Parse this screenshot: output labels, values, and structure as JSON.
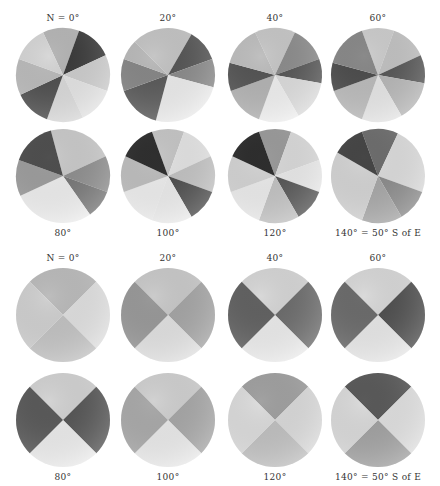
{
  "figure": {
    "upper_set": {
      "disks": [
        {
          "label": "N = 0°",
          "label_pos": "top",
          "cx": 63,
          "cy": 75,
          "r": 47,
          "sectors": [
            [
              "#b8b8b8",
              -25,
              20
            ],
            [
              "#3a3a3a",
              20,
              65
            ],
            [
              "#cfcfcf",
              65,
              110
            ],
            [
              "#e6e6e6",
              110,
              155
            ],
            [
              "#dcdcdc",
              155,
              200
            ],
            [
              "#4e4e4e",
              200,
              245
            ],
            [
              "#bdbdbd",
              245,
              290
            ],
            [
              "#d8d8d8",
              290,
              335
            ]
          ]
        },
        {
          "label": "20°",
          "label_pos": "top",
          "cx": 168,
          "cy": 75,
          "r": 47,
          "sectors": [
            [
              "#c6c6c6",
              -45,
              30
            ],
            [
              "#555555",
              30,
              70
            ],
            [
              "#8a8a8a",
              70,
              105
            ],
            [
              "#eeeeee",
              105,
              195
            ],
            [
              "#5a5a5a",
              195,
              250
            ],
            [
              "#888888",
              250,
              290
            ],
            [
              "#bcbcbc",
              290,
              315
            ]
          ]
        },
        {
          "label": "40°",
          "label_pos": "top",
          "cx": 275,
          "cy": 75,
          "r": 47,
          "sectors": [
            [
              "#c9c9c9",
              -25,
              25
            ],
            [
              "#8d8d8d",
              25,
              70
            ],
            [
              "#555555",
              70,
              100
            ],
            [
              "#dedede",
              100,
              150
            ],
            [
              "#f2f2f2",
              150,
              200
            ],
            [
              "#b5b5b5",
              200,
              250
            ],
            [
              "#555555",
              250,
              285
            ],
            [
              "#c0c0c0",
              285,
              335
            ]
          ]
        },
        {
          "label": "60°",
          "label_pos": "top",
          "cx": 378,
          "cy": 75,
          "r": 47,
          "sectors": [
            [
              "#cfcfcf",
              -20,
              20
            ],
            [
              "#c4c4c4",
              20,
              65
            ],
            [
              "#555555",
              65,
              100
            ],
            [
              "#b8b8b8",
              100,
              150
            ],
            [
              "#e8e8e8",
              150,
              200
            ],
            [
              "#bdbdbd",
              200,
              250
            ],
            [
              "#4d4d4d",
              250,
              285
            ],
            [
              "#8a8a8a",
              285,
              340
            ]
          ]
        },
        {
          "label": "80°",
          "label_pos": "bottom",
          "cx": 63,
          "cy": 176,
          "r": 47,
          "sectors": [
            [
              "#cccccc",
              -15,
              65
            ],
            [
              "#8f8f8f",
              65,
              110
            ],
            [
              "#777777",
              110,
              145
            ],
            [
              "#f0f0f0",
              145,
              245
            ],
            [
              "#9e9e9e",
              245,
              290
            ],
            [
              "#4f4f4f",
              290,
              345
            ]
          ]
        },
        {
          "label": "100°",
          "label_pos": "bottom",
          "cx": 168,
          "cy": 176,
          "r": 47,
          "sectors": [
            [
              "#c8c8c8",
              -20,
              20
            ],
            [
              "#e6e6e6",
              20,
              65
            ],
            [
              "#c4c4c4",
              65,
              110
            ],
            [
              "#4c4c4c",
              110,
              150
            ],
            [
              "#eeeeee",
              150,
              200
            ],
            [
              "#f0f0f0",
              200,
              250
            ],
            [
              "#c0c0c0",
              250,
              295
            ],
            [
              "#2f2f2f",
              295,
              340
            ]
          ]
        },
        {
          "label": "120°",
          "label_pos": "bottom",
          "cx": 275,
          "cy": 176,
          "r": 47,
          "sectors": [
            [
              "#9c9c9c",
              -20,
              20
            ],
            [
              "#dcdcdc",
              20,
              70
            ],
            [
              "#ececec",
              70,
              110
            ],
            [
              "#555555",
              110,
              150
            ],
            [
              "#c4c4c4",
              150,
              200
            ],
            [
              "#eeeeee",
              200,
              250
            ],
            [
              "#d6d6d6",
              250,
              295
            ],
            [
              "#2e2e2e",
              295,
              340
            ]
          ]
        },
        {
          "label": "140° = 50° S of E",
          "label_pos": "bottom",
          "cx": 378,
          "cy": 176,
          "r": 47,
          "sectors": [
            [
              "#6e6e6e",
              -20,
              25
            ],
            [
              "#dedede",
              25,
              110
            ],
            [
              "#8c8c8c",
              110,
              150
            ],
            [
              "#a8a8a8",
              150,
              200
            ],
            [
              "#d6d6d6",
              200,
              300
            ],
            [
              "#464646",
              300,
              340
            ]
          ]
        }
      ]
    },
    "lower_set": {
      "disks": [
        {
          "label": "N = 0°",
          "label_pos": "top",
          "cx": 63,
          "cy": 315,
          "r": 47,
          "sectors": [
            [
              "#bdbdbd",
              -45,
              45
            ],
            [
              "#e2e2e2",
              45,
              135
            ],
            [
              "#c4c4c4",
              135,
              225
            ],
            [
              "#d2d2d2",
              225,
              315
            ]
          ]
        },
        {
          "label": "20°",
          "label_pos": "top",
          "cx": 168,
          "cy": 315,
          "r": 47,
          "sectors": [
            [
              "#cbcbcb",
              -45,
              45
            ],
            [
              "#a6a6a6",
              45,
              135
            ],
            [
              "#e3e3e3",
              135,
              225
            ],
            [
              "#9a9a9a",
              225,
              315
            ]
          ]
        },
        {
          "label": "40°",
          "label_pos": "top",
          "cx": 275,
          "cy": 315,
          "r": 47,
          "sectors": [
            [
              "#d8d8d8",
              -45,
              45
            ],
            [
              "#6c6c6c",
              45,
              135
            ],
            [
              "#eeeeee",
              135,
              225
            ],
            [
              "#626262",
              225,
              315
            ]
          ]
        },
        {
          "label": "60°",
          "label_pos": "top",
          "cx": 378,
          "cy": 315,
          "r": 47,
          "sectors": [
            [
              "#dadada",
              -45,
              45
            ],
            [
              "#4e4e4e",
              45,
              135
            ],
            [
              "#eaeaea",
              135,
              225
            ],
            [
              "#6c6c6c",
              225,
              315
            ]
          ]
        },
        {
          "label": "80°",
          "label_pos": "bottom",
          "cx": 63,
          "cy": 420,
          "r": 47,
          "sectors": [
            [
              "#d4d4d4",
              -45,
              45
            ],
            [
              "#555555",
              45,
              135
            ],
            [
              "#eeeeee",
              135,
              225
            ],
            [
              "#5a5a5a",
              225,
              315
            ]
          ]
        },
        {
          "label": "100°",
          "label_pos": "bottom",
          "cx": 168,
          "cy": 420,
          "r": 47,
          "sectors": [
            [
              "#d2d2d2",
              -45,
              45
            ],
            [
              "#a8a8a8",
              45,
              135
            ],
            [
              "#ececec",
              135,
              225
            ],
            [
              "#ababab",
              225,
              315
            ]
          ]
        },
        {
          "label": "120°",
          "label_pos": "bottom",
          "cx": 275,
          "cy": 420,
          "r": 47,
          "sectors": [
            [
              "#a2a2a2",
              -45,
              45
            ],
            [
              "#dcdcdc",
              45,
              135
            ],
            [
              "#c2c2c2",
              135,
              225
            ],
            [
              "#dedede",
              225,
              315
            ]
          ]
        },
        {
          "label": "140° = 50° S of E",
          "label_pos": "bottom",
          "cx": 378,
          "cy": 420,
          "r": 47,
          "sectors": [
            [
              "#5a5a5a",
              -45,
              45
            ],
            [
              "#e2e2e2",
              45,
              135
            ],
            [
              "#a3a3a3",
              135,
              225
            ],
            [
              "#dcdcdc",
              225,
              315
            ]
          ]
        }
      ]
    }
  }
}
